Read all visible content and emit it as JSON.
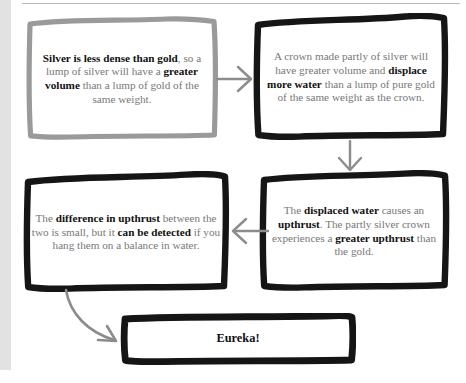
{
  "page": {
    "background_color": "#ffffff",
    "gutter_color": "#e2e2e2",
    "rule_color": "#b9b9b9",
    "body_text_color": "#777777",
    "emphasis_text_color": "#111111",
    "arrow_color": "#8c8c8c",
    "box_border_dark": "#151515",
    "box_border_grey": "#9a9a9a"
  },
  "diagram": {
    "boxes": [
      {
        "id": "silver",
        "border": "grey",
        "segments": [
          {
            "text": "Silver is less dense than gold",
            "bold": true
          },
          {
            "text": ", so a lump of silver will have a ",
            "bold": false
          },
          {
            "text": "greater volume",
            "bold": true
          },
          {
            "text": " than a lump of gold of the same weight.",
            "bold": false
          }
        ],
        "plain_text": "Silver is less dense than gold, so a lump of silver will have a greater volume than a lump of gold of the same weight."
      },
      {
        "id": "crown",
        "border": "dark",
        "segments": [
          {
            "text": "A crown made partly of silver will have greater volume and ",
            "bold": false
          },
          {
            "text": "displace more water",
            "bold": true
          },
          {
            "text": " than a lump of pure gold of the same weight as the crown.",
            "bold": false
          }
        ],
        "plain_text": "A crown made partly of silver will have greater volume and displace more water than a lump of pure gold of the same weight as the crown."
      },
      {
        "id": "upthrust",
        "border": "dark",
        "segments": [
          {
            "text": "The ",
            "bold": false
          },
          {
            "text": "displaced water",
            "bold": true
          },
          {
            "text": " causes an ",
            "bold": false
          },
          {
            "text": "upthrust",
            "bold": true
          },
          {
            "text": ". The partly silver crown experiences a ",
            "bold": false
          },
          {
            "text": "greater upthrust",
            "bold": true
          },
          {
            "text": " than the gold.",
            "bold": false
          }
        ],
        "plain_text": "The displaced water causes an upthrust. The partly silver crown experiences a greater upthrust than the gold."
      },
      {
        "id": "difference",
        "border": "dark",
        "segments": [
          {
            "text": "The ",
            "bold": false
          },
          {
            "text": "difference in upthrust",
            "bold": true
          },
          {
            "text": " between the two is small, but it ",
            "bold": false
          },
          {
            "text": "can be detected",
            "bold": true
          },
          {
            "text": " if you hang them on a balance in water.",
            "bold": false
          }
        ],
        "plain_text": "The difference in upthrust between the two is small, but it can be detected if you hang them on a balance in water."
      },
      {
        "id": "eureka",
        "border": "dark",
        "segments": [
          {
            "text": "Eureka!",
            "bold": true
          }
        ],
        "plain_text": "Eureka!"
      }
    ],
    "arrows": [
      {
        "id": "silver-to-crown",
        "direction": "right",
        "style": "straight",
        "color": "#8c8c8c"
      },
      {
        "id": "crown-to-upthrust",
        "direction": "down",
        "style": "straight",
        "color": "#8c8c8c"
      },
      {
        "id": "upthrust-to-difference",
        "direction": "left",
        "style": "straight",
        "color": "#8c8c8c"
      },
      {
        "id": "difference-to-eureka",
        "direction": "down-right",
        "style": "curved",
        "color": "#8c8c8c"
      }
    ]
  }
}
